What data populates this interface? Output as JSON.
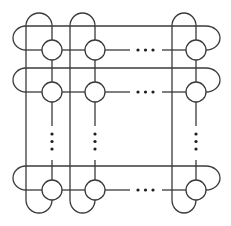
{
  "diagram": {
    "title": "Grid of nodes with wrap-around connections (torus-like topology)",
    "stroke_color": "#3a3a3a",
    "background": "#ffffff",
    "visible_columns": 3,
    "visible_rows": 3,
    "column_labels": [
      "col 1",
      "col 2",
      "col N"
    ],
    "row_labels": [
      "row 1",
      "row 2",
      "row N"
    ],
    "horizontal_ellipsis": "…",
    "vertical_ellipsis": "⋮",
    "nodes": [
      {
        "row": 1,
        "col": 1,
        "cx": 52,
        "cy": 50
      },
      {
        "row": 1,
        "col": 2,
        "cx": 95,
        "cy": 50
      },
      {
        "row": 1,
        "col": "N",
        "cx": 196,
        "cy": 50
      },
      {
        "row": 2,
        "col": 1,
        "cx": 52,
        "cy": 92
      },
      {
        "row": 2,
        "col": 2,
        "cx": 95,
        "cy": 92
      },
      {
        "row": 2,
        "col": "N",
        "cx": 196,
        "cy": 92
      },
      {
        "row": "N",
        "col": 1,
        "cx": 52,
        "cy": 190
      },
      {
        "row": "N",
        "col": 2,
        "cx": 95,
        "cy": 190
      },
      {
        "row": "N",
        "col": "N",
        "cx": 196,
        "cy": 190
      }
    ]
  },
  "captions": {
    "top_partial": "",
    "bottom_partial": ""
  }
}
